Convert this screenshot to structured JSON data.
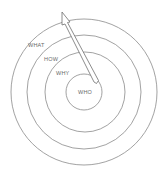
{
  "diagram": {
    "type": "concentric-circles",
    "center": [
      84,
      92
    ],
    "rings": [
      {
        "name": "what",
        "label": "WHAT",
        "radius": 73,
        "label_pos": [
          28,
          47
        ]
      },
      {
        "name": "how",
        "label": "HOW",
        "radius": 57,
        "label_pos": [
          44,
          61
        ]
      },
      {
        "name": "why",
        "label": "WHY",
        "radius": 40,
        "label_pos": [
          56,
          75
        ]
      },
      {
        "name": "who",
        "label": "WHO",
        "radius": 18,
        "label_pos": [
          79,
          93
        ]
      }
    ],
    "arrow": {
      "direction": "outward",
      "from_ring": "WHO",
      "to_ring": "WHAT",
      "tail": [
        97,
        82
      ],
      "tip": [
        62,
        12
      ]
    },
    "colors": {
      "line": "#8a8a8a",
      "text": "#6a6a6a",
      "background": "#ffffff"
    }
  }
}
